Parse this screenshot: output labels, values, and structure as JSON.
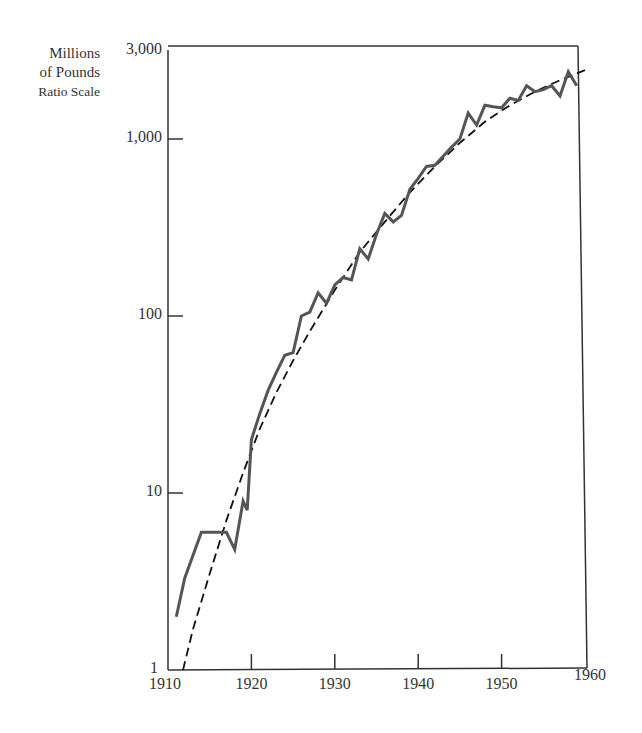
{
  "chart_data": {
    "type": "line",
    "title": "",
    "ylabel": "Millions of Pounds Ratio Scale",
    "ylabel_lines": [
      "Millions",
      "of Pounds",
      "Ratio Scale"
    ],
    "xlabel": "",
    "yscale": "log",
    "ylim": [
      1,
      3000
    ],
    "xlim": [
      1910,
      1960
    ],
    "x_ticks": [
      1910,
      1920,
      1930,
      1940,
      1950,
      1960
    ],
    "x_tick_labels": [
      "1910",
      "1920",
      "1930",
      "1940",
      "1950",
      "1960"
    ],
    "y_ticks": [
      1,
      10,
      100,
      1000,
      3000
    ],
    "y_tick_labels": [
      "1",
      "10",
      "100",
      "1,000",
      "3,000"
    ],
    "grid": false,
    "legend": null,
    "series": [
      {
        "name": "Actual",
        "style": "solid",
        "color": "#555555",
        "x": [
          1911,
          1912,
          1914,
          1917,
          1918,
          1919,
          1919.5,
          1920,
          1921,
          1922,
          1923,
          1924,
          1925,
          1926,
          1927,
          1928,
          1929,
          1930,
          1931,
          1932,
          1933,
          1934,
          1935,
          1936,
          1937,
          1938,
          1939,
          1940,
          1941,
          1942,
          1943,
          1944,
          1945,
          1946,
          1947,
          1948,
          1949,
          1950,
          1951,
          1952,
          1953,
          1954,
          1955,
          1956,
          1957,
          1958,
          1959
        ],
        "y": [
          2.0,
          3.3,
          6,
          6,
          4.8,
          9,
          8,
          20,
          28,
          38,
          48,
          60,
          62,
          100,
          105,
          135,
          118,
          150,
          165,
          160,
          240,
          210,
          290,
          380,
          340,
          370,
          520,
          600,
          700,
          710,
          800,
          900,
          1000,
          1400,
          1200,
          1550,
          1520,
          1500,
          1700,
          1650,
          2000,
          1850,
          1900,
          2000,
          1750,
          2400,
          2000
        ]
      },
      {
        "name": "Trend",
        "style": "dashed",
        "color": "#111111",
        "x": [
          1911.8,
          1913,
          1915,
          1917,
          1919,
          1921,
          1923,
          1925,
          1927,
          1930,
          1933,
          1936,
          1939,
          1942,
          1945,
          1948,
          1951,
          1954,
          1957,
          1960
        ],
        "y": [
          1,
          1.7,
          3.5,
          7,
          13,
          23,
          37,
          56,
          82,
          140,
          230,
          340,
          500,
          700,
          950,
          1250,
          1550,
          1850,
          2150,
          2450
        ]
      }
    ]
  }
}
